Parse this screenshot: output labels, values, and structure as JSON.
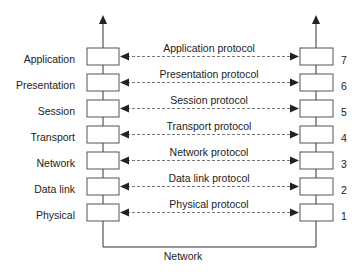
{
  "diagram": {
    "layers": [
      {
        "number": "7",
        "name": "Application",
        "protocol": "Application protocol"
      },
      {
        "number": "6",
        "name": "Presentation",
        "protocol": "Presentation protocol"
      },
      {
        "number": "5",
        "name": "Session",
        "protocol": "Session protocol"
      },
      {
        "number": "4",
        "name": "Transport",
        "protocol": "Transport protocol"
      },
      {
        "number": "3",
        "name": "Network",
        "protocol": "Network protocol"
      },
      {
        "number": "2",
        "name": "Data link",
        "protocol": "Data link protocol"
      },
      {
        "number": "1",
        "name": "Physical",
        "protocol": "Physical protocol"
      }
    ],
    "network_label": "Network",
    "colors": {
      "line": "#333333",
      "box_border": "#555555",
      "dash": "#555555"
    }
  }
}
